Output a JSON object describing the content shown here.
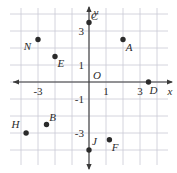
{
  "figure": {
    "background_color": "#ffffff",
    "grid_color": "#c9c9d4",
    "axis_color": "#3a3a3a",
    "point_color": "#2b2b2b",
    "label_color": "#2b2b2b"
  },
  "chart_data": {
    "type": "scatter",
    "title": "",
    "xlabel": "x",
    "ylabel": "y",
    "xlim": [
      -4.65,
      4.65
    ],
    "ylim": [
      -4.35,
      4.35
    ],
    "grid": true,
    "grid_spacing": 1,
    "legend": "none",
    "axis_arrows": [
      "left",
      "right",
      "up",
      "down"
    ],
    "origin_label": "O",
    "xticks": [
      -3,
      1,
      3
    ],
    "xticklabels": [
      "-3",
      "1",
      "3"
    ],
    "yticks": [
      3,
      1,
      -1,
      -3
    ],
    "yticklabels": [
      "3",
      "1",
      "-1",
      "-3"
    ],
    "points": [
      {
        "label": "C",
        "x": 0.0,
        "y": 3.5,
        "label_dx": 0.32,
        "label_dy": -0.38
      },
      {
        "label": "N",
        "x": -3.0,
        "y": 2.5,
        "label_dx": -0.62,
        "label_dy": 0.42
      },
      {
        "label": "A",
        "x": 2.0,
        "y": 2.5,
        "label_dx": 0.36,
        "label_dy": 0.45
      },
      {
        "label": "E",
        "x": -2.0,
        "y": 1.5,
        "label_dx": 0.34,
        "label_dy": 0.44
      },
      {
        "label": "D",
        "x": 3.5,
        "y": 0.0,
        "label_dx": 0.3,
        "label_dy": 0.52
      },
      {
        "label": "B",
        "x": -2.5,
        "y": -2.5,
        "label_dx": 0.36,
        "label_dy": -0.42
      },
      {
        "label": "H",
        "x": -3.7,
        "y": -3.0,
        "label_dx": -0.62,
        "label_dy": -0.48
      },
      {
        "label": "F",
        "x": 1.2,
        "y": -3.4,
        "label_dx": 0.34,
        "label_dy": 0.46
      },
      {
        "label": "J",
        "x": 0.0,
        "y": -4.0,
        "label_dx": 0.32,
        "label_dy": -0.48
      }
    ]
  }
}
